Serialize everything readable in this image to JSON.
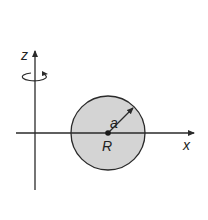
{
  "diagram": {
    "type": "geometry",
    "labels": {
      "z_axis": "z",
      "x_axis": "x",
      "radius": "a",
      "center": "R"
    },
    "colors": {
      "line": "#2a2a2a",
      "disk_fill": "#d4d4d4",
      "background": "#ffffff"
    },
    "elements": {
      "z_axis": {
        "x": 35,
        "y_top": 50,
        "y_bottom": 190
      },
      "x_axis": {
        "y": 133,
        "x_left": 16,
        "x_right": 195
      },
      "disk": {
        "cx": 108,
        "cy": 133,
        "r": 37
      },
      "rotation_indicator": {
        "cx": 35,
        "cy": 77,
        "rx": 13,
        "ry": 4
      }
    }
  }
}
